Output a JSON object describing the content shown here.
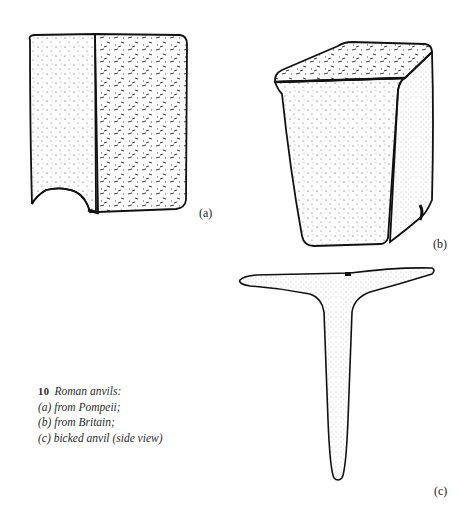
{
  "figure": {
    "number": "10",
    "caption_title": "Roman anvils:",
    "caption_lines": [
      "(a) from Pompeii;",
      "(b) from Britain;",
      "(c) bicked anvil (side view)"
    ]
  },
  "drawings": [
    {
      "id": "a",
      "label": "(a)",
      "description": "block anvil from Pompeii, stippled illustration"
    },
    {
      "id": "b",
      "label": "(b)",
      "description": "tapered block anvil from Britain, stippled illustration"
    },
    {
      "id": "c",
      "label": "(c)",
      "description": "T-shaped bicked anvil, side view"
    }
  ],
  "colors": {
    "ink": "#111111",
    "paper": "#ffffff"
  }
}
